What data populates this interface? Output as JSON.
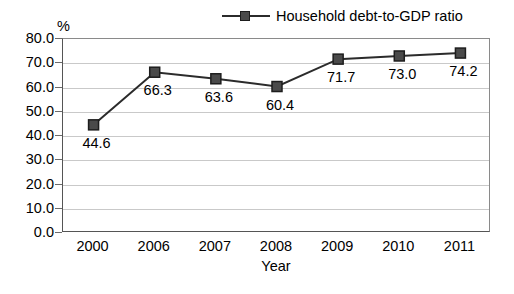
{
  "chart_data": {
    "type": "line",
    "title": "",
    "xlabel": "Year",
    "ylabel": "%",
    "categories": [
      "2000",
      "2006",
      "2007",
      "2008",
      "2009",
      "2010",
      "2011"
    ],
    "series": [
      {
        "name": "Household debt-to-GDP ratio",
        "values": [
          44.6,
          66.3,
          63.6,
          60.4,
          71.7,
          73.0,
          74.2
        ],
        "labels": [
          "44.6",
          "66.3",
          "63.6",
          "60.4",
          "71.7",
          "73.0",
          "74.2"
        ],
        "color": "#4a4a4a",
        "line_color": "#2b2b2b",
        "marker": "square"
      }
    ],
    "ylim": [
      0,
      80
    ],
    "ytick_step": 10,
    "ytick_labels": [
      "80.0",
      "70.0",
      "60.0",
      "50.0",
      "40.0",
      "30.0",
      "20.0",
      "10.0",
      "0.0"
    ],
    "ytick_values": [
      80,
      70,
      60,
      50,
      40,
      30,
      20,
      10,
      0
    ],
    "grid": true,
    "legend_position": "top",
    "grid_color": "#c9c9c9",
    "axis_color": "#555555"
  },
  "legend": {
    "entries": [
      {
        "label": "Household debt-to-GDP ratio"
      }
    ]
  }
}
